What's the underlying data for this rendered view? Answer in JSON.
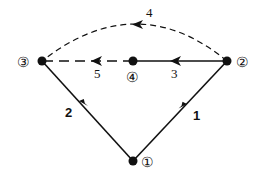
{
  "diagram": {
    "type": "directed-graph",
    "colors": {
      "line": "#111111",
      "background": "#ffffff"
    },
    "nodes": [
      {
        "id": "1",
        "label": "①",
        "x": 133,
        "y": 161
      },
      {
        "id": "2",
        "label": "②",
        "x": 227,
        "y": 61
      },
      {
        "id": "3",
        "label": "③",
        "x": 42,
        "y": 61
      },
      {
        "id": "4",
        "label": "④",
        "x": 133,
        "y": 61
      }
    ],
    "edges": [
      {
        "id": "e1",
        "label": "1",
        "from": "1",
        "to": "2",
        "style": "solid"
      },
      {
        "id": "e2",
        "label": "2",
        "from": "1",
        "to": "3",
        "style": "solid"
      },
      {
        "id": "e3",
        "label": "3",
        "from": "2",
        "to": "4",
        "style": "solid"
      },
      {
        "id": "e4",
        "label": "4",
        "from": "2",
        "to": "3",
        "style": "dashed-arc"
      },
      {
        "id": "e5",
        "label": "5",
        "from": "4",
        "to": "3",
        "style": "dashed"
      }
    ]
  }
}
